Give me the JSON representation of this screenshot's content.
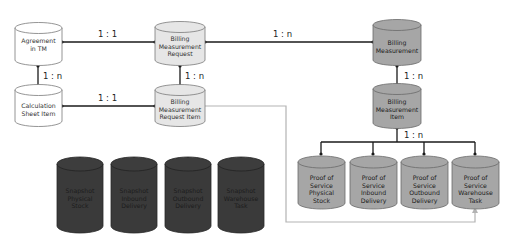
{
  "diagram": {
    "colors": {
      "white_fill": "#ffffff",
      "light_fill": "#e6e6e6",
      "mid_fill": "#a6a6a6",
      "dark_fill": "#3a3a3a",
      "line": "#1a1a1a",
      "gray_line": "#b3b3b3"
    },
    "nodes": {
      "agreement": {
        "lines": [
          "Agreement",
          "in TM"
        ]
      },
      "calc_sheet": {
        "lines": [
          "Calculation",
          "Sheet Item"
        ]
      },
      "bmr": {
        "lines": [
          "Billing",
          "Measurement",
          "Request"
        ]
      },
      "bmr_item": {
        "lines": [
          "Billing",
          "Measurement",
          "Request Item"
        ]
      },
      "bm": {
        "lines": [
          "Billing",
          "Measurement"
        ]
      },
      "bm_item": {
        "lines": [
          "Billing",
          "Measurement",
          "Item"
        ]
      },
      "pos_stock": {
        "lines": [
          "Proof of",
          "Service",
          "Physical",
          "Stock"
        ]
      },
      "pos_inbound": {
        "lines": [
          "Proof of",
          "Service",
          "Inbound",
          "Delivery"
        ]
      },
      "pos_outbound": {
        "lines": [
          "Proof of",
          "Service",
          "Outbound",
          "Delivery"
        ]
      },
      "pos_task": {
        "lines": [
          "Proof of",
          "Service",
          "Warehouse",
          "Task"
        ]
      },
      "snap_stock": {
        "lines": [
          "Snapshot",
          "Physical",
          "Stock"
        ]
      },
      "snap_inbound": {
        "lines": [
          "Snapshot",
          "Inbound",
          "Delivery"
        ]
      },
      "snap_outbound": {
        "lines": [
          "Snapshot",
          "Outbound",
          "Delivery"
        ]
      },
      "snap_task": {
        "lines": [
          "Snapshot",
          "Warehouse",
          "Task"
        ]
      }
    },
    "cardinalities": {
      "agreement_bmr": "1 : 1",
      "agreement_calc": "1 : n",
      "calc_bmritem": "1 : 1",
      "bmr_bmritem": "1 : n",
      "bmr_bm": "1 : n",
      "bm_bmitem": "1 : n",
      "bmitem_pos": "1 : n"
    }
  }
}
